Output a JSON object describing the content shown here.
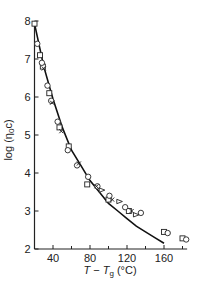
{
  "chart_data": {
    "type": "scatter",
    "title": "",
    "xlabel": "T − Tg (°C)",
    "ylabel": "log (η0c)",
    "xlim": [
      20,
      185
    ],
    "ylim": [
      2,
      8
    ],
    "x_ticks": [
      40,
      80,
      120,
      160
    ],
    "x_minor_ticks": [
      60,
      100,
      140,
      180
    ],
    "y_ticks": [
      2,
      3,
      4,
      5,
      6,
      7,
      8
    ],
    "grid": false,
    "legend": null,
    "series": [
      {
        "name": "squares",
        "marker": "square",
        "points": [
          [
            20,
            7.93
          ],
          [
            26,
            7.1
          ],
          [
            29,
            6.8
          ],
          [
            36,
            6.1
          ],
          [
            47,
            5.2
          ],
          [
            57,
            4.7
          ],
          [
            77,
            3.7
          ],
          [
            100,
            3.3
          ],
          [
            122,
            3.0
          ],
          [
            160,
            2.45
          ],
          [
            180,
            2.28
          ]
        ]
      },
      {
        "name": "circles",
        "marker": "circle",
        "points": [
          [
            23,
            7.4
          ],
          [
            28,
            6.9
          ],
          [
            34,
            6.3
          ],
          [
            38,
            5.9
          ],
          [
            45,
            5.35
          ],
          [
            56,
            4.6
          ],
          [
            66,
            4.2
          ],
          [
            78,
            3.9
          ],
          [
            88,
            3.65
          ],
          [
            101,
            3.4
          ],
          [
            118,
            3.1
          ],
          [
            135,
            2.95
          ],
          [
            164,
            2.42
          ],
          [
            184,
            2.25
          ]
        ]
      },
      {
        "name": "triangles",
        "marker": "triangle",
        "points": [
          [
            93,
            3.55
          ],
          [
            112,
            3.25
          ],
          [
            130,
            2.9
          ]
        ]
      },
      {
        "name": "crosses",
        "marker": "x",
        "points": [
          [
            30,
            6.75
          ],
          [
            39,
            5.85
          ],
          [
            49,
            5.1
          ],
          [
            68,
            4.25
          ],
          [
            87,
            3.65
          ],
          [
            104,
            3.3
          ],
          [
            125,
            3.0
          ]
        ]
      },
      {
        "name": "fit",
        "type": "line",
        "points": [
          [
            20,
            7.93
          ],
          [
            30,
            6.8
          ],
          [
            40,
            5.95
          ],
          [
            50,
            5.2
          ],
          [
            60,
            4.6
          ],
          [
            70,
            4.2
          ],
          [
            80,
            3.8
          ],
          [
            90,
            3.5
          ],
          [
            100,
            3.2
          ],
          [
            110,
            3.0
          ],
          [
            120,
            2.8
          ],
          [
            130,
            2.6
          ],
          [
            140,
            2.45
          ],
          [
            150,
            2.3
          ],
          [
            160,
            2.15
          ]
        ]
      }
    ]
  },
  "labels": {
    "y_axis": "log (η",
    "y_axis_sub": "0",
    "y_axis_end": "c)",
    "x_axis_T": "T",
    "x_axis_minus": " − ",
    "x_axis_Tg": "T",
    "x_axis_g": "g",
    "x_axis_unit": " (°C)"
  }
}
